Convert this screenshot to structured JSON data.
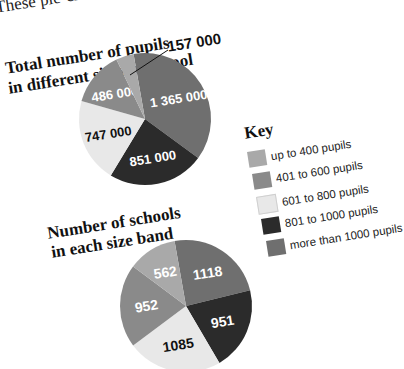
{
  "intro_text": "These pie-charts",
  "colors": {
    "up_to_400": "#a9a9a9",
    "401_to_600": "#8a8a8a",
    "601_to_800": "#e8e8e8",
    "801_to_1000": "#2b2b2b",
    "more_than_1000": "#6f6f6f"
  },
  "key": {
    "title": "Key",
    "items": [
      {
        "label": "up to 400 pupils",
        "color": "#a9a9a9"
      },
      {
        "label": "401 to 600 pupils",
        "color": "#8a8a8a"
      },
      {
        "label": "601 to 800 pupils",
        "color": "#e8e8e8"
      },
      {
        "label": "801 to 1000 pupils",
        "color": "#2b2b2b"
      },
      {
        "label": "more than 1000 pupils",
        "color": "#6f6f6f"
      }
    ]
  },
  "chart_data": [
    {
      "type": "pie",
      "title": "Total number of pupils in different sizes of school",
      "title_lines": [
        "Total number of pupils",
        "in different sizes of school"
      ],
      "categories": [
        "up to 400 pupils",
        "401 to 600 pupils",
        "601 to 800 pupils",
        "801 to 1000 pupils",
        "more than 1000 pupils"
      ],
      "values": [
        157000,
        486000,
        747000,
        851000,
        1365000
      ],
      "labels": [
        "157 000",
        "486 000",
        "747 000",
        "851 000",
        "1 365 000"
      ],
      "legend_position": "right"
    },
    {
      "type": "pie",
      "title": "Number of schools in each size band",
      "title_lines": [
        "Number of schools",
        "in each size band"
      ],
      "categories": [
        "up to 400 pupils",
        "401 to 600 pupils",
        "601 to 800 pupils",
        "801 to 1000 pupils",
        "more than 1000 pupils"
      ],
      "values": [
        562,
        952,
        1085,
        951,
        1118
      ],
      "labels": [
        "562",
        "952",
        "1085",
        "951",
        "1118"
      ],
      "legend_position": "right"
    }
  ]
}
